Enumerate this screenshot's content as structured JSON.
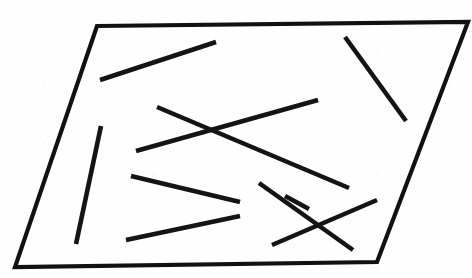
{
  "figure": {
    "type": "line-drawing",
    "canvas": {
      "width": 472,
      "height": 278
    },
    "background_color": "#fefefe",
    "ink_color": "#111111"
  },
  "frame": {
    "name": "parallelogram-border",
    "shape": "parallelogram",
    "stroke_color": "#111111",
    "stroke_width": 4.2,
    "closed": true,
    "vertices": [
      {
        "label": "top-left",
        "x": 97,
        "y": 26
      },
      {
        "label": "top-right",
        "x": 468,
        "y": 22
      },
      {
        "label": "bottom-right",
        "x": 377,
        "y": 262
      },
      {
        "label": "bottom-left",
        "x": 15,
        "y": 267
      }
    ],
    "vertex_points": "97,26 468,22 377,262 15,267"
  },
  "segments": {
    "count": 10,
    "stroke_color": "#141414",
    "stroke_width": 4.6,
    "items": [
      {
        "id": "segment-1",
        "name": "upper-left-diagonal",
        "x1": 100,
        "y1": 80,
        "x2": 216,
        "y2": 42,
        "orientation": "rising-right"
      },
      {
        "id": "segment-2",
        "name": "upper-right-diagonal",
        "x1": 345,
        "y1": 37,
        "x2": 406,
        "y2": 121,
        "orientation": "falling-right"
      },
      {
        "id": "segment-3",
        "name": "center-x-falling-stroke",
        "x1": 157,
        "y1": 107,
        "x2": 349,
        "y2": 188,
        "orientation": "falling-right"
      },
      {
        "id": "segment-4",
        "name": "center-x-rising-stroke",
        "x1": 136,
        "y1": 151,
        "x2": 318,
        "y2": 100,
        "orientation": "rising-right"
      },
      {
        "id": "segment-5",
        "name": "left-near-vertical",
        "x1": 101,
        "y1": 126,
        "x2": 76,
        "y2": 244,
        "orientation": "near-vertical"
      },
      {
        "id": "segment-6",
        "name": "middle-shallow-falling",
        "x1": 131,
        "y1": 176,
        "x2": 240,
        "y2": 202,
        "orientation": "falling-right"
      },
      {
        "id": "segment-7",
        "name": "lower-shallow-rising",
        "x1": 126,
        "y1": 240,
        "x2": 240,
        "y2": 216,
        "orientation": "rising-right"
      },
      {
        "id": "segment-8",
        "name": "lower-x-falling-stroke",
        "x1": 259,
        "y1": 183,
        "x2": 353,
        "y2": 250,
        "orientation": "falling-right"
      },
      {
        "id": "segment-9",
        "name": "lower-x-rising-stroke",
        "x1": 272,
        "y1": 245,
        "x2": 377,
        "y2": 200,
        "orientation": "rising-right"
      },
      {
        "id": "segment-10",
        "name": "short-upper-right-stub",
        "x1": 285,
        "y1": 196,
        "x2": 309,
        "y2": 209,
        "orientation": "falling-right"
      }
    ]
  }
}
